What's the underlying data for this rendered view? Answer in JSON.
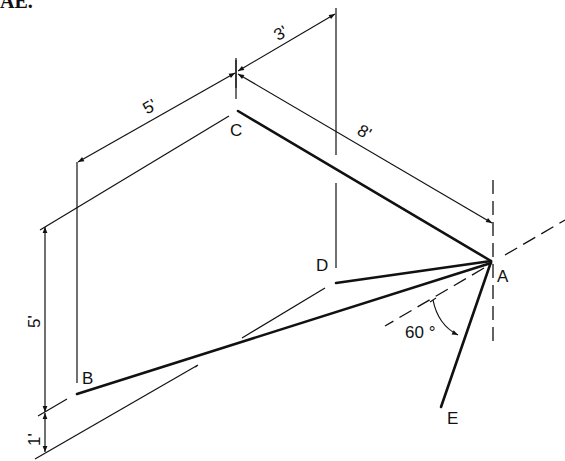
{
  "header": {
    "text": "AE."
  },
  "points": {
    "A": "A",
    "B": "B",
    "C": "C",
    "D": "D",
    "E": "E"
  },
  "dimensions": {
    "top": "3'",
    "upper_left": "5'",
    "right_diagonal": "8'",
    "vertical_left": "5'",
    "vertical_bottom": "1'"
  },
  "angle": {
    "label": "60 °",
    "value_deg": 60
  },
  "colors": {
    "line": "#111111",
    "background": "#ffffff"
  }
}
